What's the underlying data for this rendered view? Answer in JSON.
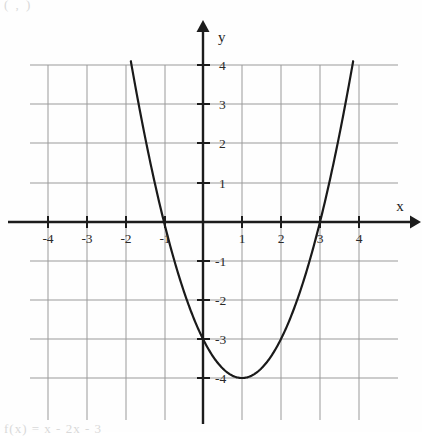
{
  "page": {
    "top_fragment": "( , )",
    "bottom_fragment": "f(x) = x  - 2x - 3"
  },
  "axes": {
    "x_axis_name": "x",
    "y_axis_name": "y",
    "x_tick_labels": [
      "-4",
      "-3",
      "-2",
      "-1",
      "1",
      "2",
      "3",
      "4"
    ],
    "y_tick_labels": [
      "4",
      "3",
      "2",
      "1",
      "-1",
      "-2",
      "-3",
      "-4"
    ]
  },
  "colors": {
    "grid": "#9a9a9a",
    "axis": "#1c1c1c",
    "curve": "#1a1a1a",
    "background": "#fefefe"
  },
  "chart_data": {
    "type": "line",
    "title": "",
    "xlabel": "x",
    "ylabel": "y",
    "xlim": [
      -4.4,
      4.4
    ],
    "ylim": [
      -4.6,
      4.7
    ],
    "grid": true,
    "legend": "none",
    "xticks": [
      -4,
      -3,
      -2,
      -1,
      1,
      2,
      3,
      4
    ],
    "yticks": [
      4,
      3,
      2,
      1,
      -1,
      -2,
      -3,
      -4
    ],
    "equation": "y = x^2 - 2x - 3",
    "factored": "y = (x - 3)(x + 1)",
    "vertex": [
      1,
      -4
    ],
    "roots": [
      -1,
      3
    ],
    "y_intercept": -3,
    "axis_of_symmetry": 1,
    "opens": "upward",
    "series": [
      {
        "name": "y = x^2 - 2x - 3",
        "x": [
          -1.85,
          -1.7,
          -1.5,
          -1.25,
          -1,
          -0.75,
          -0.5,
          -0.25,
          0,
          0.25,
          0.5,
          0.75,
          1,
          1.25,
          1.5,
          1.75,
          2,
          2.25,
          2.5,
          2.75,
          3,
          3.25,
          3.5,
          3.75,
          3.85
        ],
        "y": [
          4.12,
          3.29,
          2.25,
          1.06,
          0,
          -0.94,
          -1.75,
          -2.44,
          -3,
          -3.44,
          -3.75,
          -3.94,
          -4,
          -3.94,
          -3.75,
          -3.44,
          -3,
          -2.44,
          -1.75,
          -0.94,
          0,
          1.06,
          2.25,
          3.56,
          4.12
        ]
      }
    ]
  }
}
